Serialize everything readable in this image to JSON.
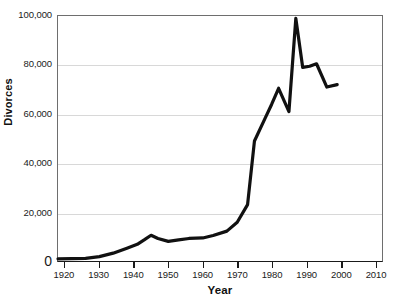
{
  "chart_data": {
    "type": "line",
    "title": "",
    "xlabel": "Year",
    "ylabel": "Divorces",
    "xlim": [
      1918,
      2012
    ],
    "ylim": [
      0,
      100000
    ],
    "grid": true,
    "legend": "none",
    "x_ticks": [
      1920,
      1930,
      1940,
      1950,
      1960,
      1970,
      1980,
      1990,
      2000,
      2010
    ],
    "x_tick_labels": [
      "1920",
      "1930",
      "1940",
      "1950",
      "1960",
      "1970",
      "1980",
      "1990",
      "2000",
      "2010"
    ],
    "y_ticks": [
      0,
      20000,
      40000,
      60000,
      80000,
      100000
    ],
    "y_tick_labels": [
      "0",
      "20,000",
      "40,000",
      "60,000",
      "80,000",
      "100,000"
    ],
    "series": [
      {
        "name": "Divorces",
        "color": "#111111",
        "line_width": 3.2,
        "x": [
          1918,
          1922,
          1926,
          1930,
          1934,
          1938,
          1941,
          1943,
          1945,
          1947,
          1950,
          1953,
          1956,
          1960,
          1963,
          1967,
          1970,
          1973,
          1975,
          1978,
          1980,
          1982,
          1985,
          1987,
          1989,
          1991,
          1993,
          1996,
          1999
        ],
        "values": [
          900,
          950,
          1100,
          1800,
          3200,
          5200,
          6800,
          8600,
          10500,
          9200,
          8000,
          8600,
          9200,
          9400,
          10400,
          12200,
          15800,
          23000,
          49000,
          58000,
          64000,
          70500,
          61000,
          99000,
          79000,
          79500,
          80500,
          71000,
          72000
        ]
      }
    ]
  },
  "axes": {
    "y_title": "Divorces",
    "x_title": "Year"
  }
}
